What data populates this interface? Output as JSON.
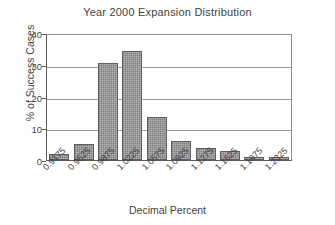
{
  "chart_data": {
    "type": "bar",
    "title": "Year 2000 Expansion Distribution",
    "xlabel": "Decimal Percent",
    "ylabel": "% of Success Cases",
    "categories": [
      "0.9175",
      "0.9525",
      "0.9875",
      "1.0225",
      "1.0575",
      "1.0925",
      "1.1275",
      "1.1625",
      "1.1975",
      "1.2325"
    ],
    "values": [
      2,
      5,
      30.6,
      34.4,
      13.6,
      6,
      3.9,
      2.7,
      1,
      1.1
    ],
    "ylim": [
      0,
      40
    ],
    "yticks": [
      0,
      10,
      20,
      30,
      40
    ],
    "ytick_labels": [
      "0",
      "10",
      "20",
      "30",
      "40"
    ],
    "grid": "horizontal",
    "legend": "none",
    "bar_color": "#8c8c8c",
    "bar_edge_color": "#5f5f5f",
    "axis_color": "#5a5a5a"
  }
}
